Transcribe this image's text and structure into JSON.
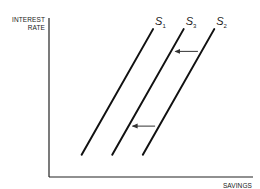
{
  "chart_data": {
    "type": "line",
    "title": "",
    "xlabel": "SAVINGS",
    "ylabel_lines": [
      "INTEREST",
      "RATE"
    ],
    "xlim": [
      0,
      10
    ],
    "ylim": [
      0,
      10
    ],
    "grid": false,
    "legend": "none",
    "series": [
      {
        "name": "S1",
        "label_main": "S",
        "label_sub": "1",
        "x": [
          1.6,
          5.1
        ],
        "y": [
          1.4,
          9.3
        ]
      },
      {
        "name": "S3",
        "label_main": "S",
        "label_sub": "3",
        "x": [
          3.1,
          6.6
        ],
        "y": [
          1.4,
          9.3
        ]
      },
      {
        "name": "S2",
        "label_main": "S",
        "label_sub": "2",
        "x": [
          4.6,
          8.1
        ],
        "y": [
          1.4,
          9.3
        ]
      }
    ],
    "annotations": [
      {
        "type": "arrow",
        "description": "shift from S2 toward S3 (upper)",
        "from": [
          7.3,
          7.9
        ],
        "to": [
          6.2,
          7.9
        ]
      },
      {
        "type": "arrow",
        "description": "shift from S2 toward S3 (lower)",
        "from": [
          5.2,
          3.2
        ],
        "to": [
          4.1,
          3.2
        ]
      }
    ]
  },
  "colors": {
    "line": "#111111",
    "arrow": "#333333",
    "axis": "#222222",
    "background": "#ffffff"
  }
}
